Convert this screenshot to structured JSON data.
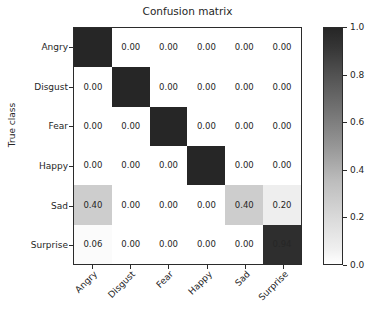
{
  "chart_data": {
    "type": "heatmap",
    "title": "Confusion matrix",
    "xlabel": "",
    "ylabel": "True class",
    "categories": [
      "Angry",
      "Disgust",
      "Fear",
      "Happy",
      "Sad",
      "Surprise"
    ],
    "x_tick_labels": [
      "Angry",
      "Disgust",
      "Fear",
      "Happy",
      "Sad",
      "Surprise"
    ],
    "y_tick_labels": [
      "Angry",
      "Disgust",
      "Fear",
      "Happy",
      "Sad",
      "Surprise"
    ],
    "rows": [
      {
        "label": "Angry",
        "values": [
          1.0,
          0.0,
          0.0,
          0.0,
          0.0,
          0.0
        ]
      },
      {
        "label": "Disgust",
        "values": [
          0.0,
          1.0,
          0.0,
          0.0,
          0.0,
          0.0
        ]
      },
      {
        "label": "Fear",
        "values": [
          0.0,
          0.0,
          1.0,
          0.0,
          0.0,
          0.0
        ]
      },
      {
        "label": "Happy",
        "values": [
          0.0,
          0.0,
          0.0,
          1.0,
          0.0,
          0.0
        ]
      },
      {
        "label": "Sad",
        "values": [
          0.4,
          0.0,
          0.0,
          0.0,
          0.4,
          0.2
        ]
      },
      {
        "label": "Surprise",
        "values": [
          0.06,
          0.0,
          0.0,
          0.0,
          0.0,
          0.94
        ]
      }
    ],
    "cell_text": [
      [
        "1.00",
        "0.00",
        "0.00",
        "0.00",
        "0.00",
        "0.00"
      ],
      [
        "0.00",
        "1.00",
        "0.00",
        "0.00",
        "0.00",
        "0.00"
      ],
      [
        "0.00",
        "0.00",
        "1.00",
        "0.00",
        "0.00",
        "0.00"
      ],
      [
        "0.00",
        "0.00",
        "0.00",
        "1.00",
        "0.00",
        "0.00"
      ],
      [
        "0.40",
        "0.00",
        "0.00",
        "0.00",
        "0.40",
        "0.20"
      ],
      [
        "0.06",
        "0.00",
        "0.00",
        "0.00",
        "0.00",
        "0.94"
      ]
    ],
    "colormap": "Greys",
    "colorbar": {
      "ticks": [
        "0.0",
        "0.2",
        "0.4",
        "0.6",
        "0.8",
        "1.0"
      ],
      "vmin": 0.0,
      "vmax": 1.0,
      "position": "right",
      "orientation": "vertical"
    },
    "grid": false,
    "legend": null,
    "colors": {
      "low": "#ffffff",
      "high": "#262626",
      "axis": "#2b2b2b",
      "text": "#262626",
      "background": "#ffffff"
    }
  }
}
